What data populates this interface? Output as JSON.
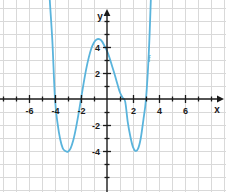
{
  "caption": {
    "text": "gleichung:"
  },
  "chart_data": {
    "type": "line",
    "title": "",
    "xlabel": "x",
    "ylabel": "y",
    "xlim": [
      -7.6,
      7.2
    ],
    "ylim": [
      -6.6,
      6.1
    ],
    "grid": true,
    "legend_position": "inline-right",
    "series": [
      {
        "name": "f",
        "color": "#5ab4dc",
        "label": "f",
        "label_x": 3.25,
        "label_y": 3.05,
        "roots": [
          -4,
          -2,
          1.4,
          3
        ],
        "local_minima": [
          [
            -3,
            -4
          ],
          [
            2.2,
            -4
          ]
        ],
        "local_maxima": [
          [
            -0.6,
            4.6
          ]
        ],
        "x": [
          -4.75,
          -4.6,
          -4.4,
          -4.2,
          -4.0,
          -3.8,
          -3.6,
          -3.4,
          -3.2,
          -3.0,
          -2.8,
          -2.6,
          -2.4,
          -2.2,
          -2.0,
          -1.8,
          -1.6,
          -1.4,
          -1.2,
          -1.0,
          -0.8,
          -0.6,
          -0.4,
          -0.2,
          0.0,
          0.2,
          0.4,
          0.6,
          0.8,
          1.0,
          1.2,
          1.4,
          1.6,
          1.8,
          2.0,
          2.2,
          2.4,
          2.6,
          2.8,
          3.0,
          3.2,
          3.35,
          3.5
        ],
        "y": [
          14.6,
          11.2,
          7.6,
          4.4,
          0.0,
          -1.9,
          -3.1,
          -3.8,
          -4.0,
          -4.05,
          -3.8,
          -3.2,
          -2.3,
          -1.2,
          0.0,
          1.2,
          2.3,
          3.2,
          3.9,
          4.35,
          4.58,
          4.6,
          4.45,
          4.1,
          3.7,
          3.15,
          2.5,
          1.85,
          1.15,
          0.5,
          0.1,
          -0.2,
          -1.8,
          -2.9,
          -3.7,
          -4.0,
          -3.8,
          -3.0,
          -1.6,
          0.0,
          3.2,
          7.0,
          11.5
        ]
      }
    ],
    "x_ticks": [
      {
        "value": -6,
        "label": "-6"
      },
      {
        "value": -4,
        "label": "-4"
      },
      {
        "value": -2,
        "label": "-2"
      },
      {
        "value": 2,
        "label": "2"
      },
      {
        "value": 4,
        "label": "4"
      },
      {
        "value": 6,
        "label": "6"
      }
    ],
    "x_minor_ticks": [
      -7,
      -5,
      -3,
      -1,
      1,
      3,
      5,
      7
    ],
    "y_ticks": [
      {
        "value": 4,
        "label": "4"
      },
      {
        "value": 2,
        "label": "2"
      },
      {
        "value": -2,
        "label": "-2"
      },
      {
        "value": -4,
        "label": "-4"
      }
    ],
    "y_minor_ticks": [
      5,
      3,
      1,
      -1,
      -3,
      -5,
      -6
    ],
    "colors": {
      "curve": "#5ab4dc",
      "axis": "#1a1a1a",
      "grid": "#d9d9d9",
      "background": "#ffffff",
      "tick_text": "#1a1a1a",
      "curve_label": "#5aa9cf"
    }
  }
}
